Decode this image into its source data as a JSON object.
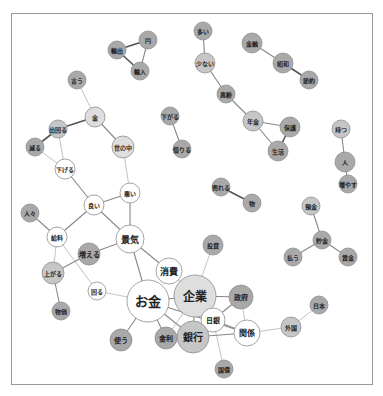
{
  "diagram": {
    "type": "co-occurrence network",
    "frame": {
      "x": 11,
      "y": 13,
      "w": 362,
      "h": 372
    },
    "colors": {
      "dark": "#a9a9a9",
      "medium": "#c6c6c6",
      "light": "#dedede",
      "white": "#ffffff",
      "stroke": "#8e8e8e",
      "edge_strong": "#555555",
      "edge_mid": "#888888",
      "edge_weak": "#c4c4c4"
    },
    "nodes": [
      {
        "id": "yushutsu",
        "label": "輸出",
        "x": 117,
        "y": 50,
        "r": 9,
        "fill": "dark",
        "fs": 6
      },
      {
        "id": "en",
        "label": "円",
        "x": 148,
        "y": 40,
        "r": 9,
        "fill": "dark",
        "fs": 6
      },
      {
        "id": "yunyu",
        "label": "輸入",
        "x": 140,
        "y": 71,
        "r": 9,
        "fill": "dark",
        "fs": 6
      },
      {
        "id": "ou",
        "label": "言う",
        "x": 77,
        "y": 80,
        "r": 9,
        "fill": "dark",
        "fs": 6
      },
      {
        "id": "kane",
        "label": "金",
        "x": 95,
        "y": 117,
        "r": 10,
        "fill": "light",
        "fs": 6
      },
      {
        "id": "demawaru",
        "label": "出回る",
        "x": 58,
        "y": 129,
        "r": 9,
        "fill": "medium",
        "fs": 6
      },
      {
        "id": "heru",
        "label": "減る",
        "x": 35,
        "y": 147,
        "r": 9,
        "fill": "dark",
        "fs": 6
      },
      {
        "id": "yononaka",
        "label": "世の中",
        "x": 123,
        "y": 147,
        "r": 11,
        "fill": "light",
        "fs": 6
      },
      {
        "id": "sageru",
        "label": "下げる",
        "x": 65,
        "y": 169,
        "r": 10,
        "fill": "white",
        "fs": 6
      },
      {
        "id": "sagaru",
        "label": "下がる",
        "x": 170,
        "y": 116,
        "r": 9,
        "fill": "dark",
        "fs": 6
      },
      {
        "id": "heru2",
        "label": "借りる",
        "x": 182,
        "y": 149,
        "r": 9,
        "fill": "dark",
        "fs": 6
      },
      {
        "id": "ooi",
        "label": "多い",
        "x": 203,
        "y": 31,
        "r": 9,
        "fill": "dark",
        "fs": 6
      },
      {
        "id": "sukunai",
        "label": "少ない",
        "x": 205,
        "y": 63,
        "r": 10,
        "fill": "medium",
        "fs": 6
      },
      {
        "id": "koreisha",
        "label": "高齢",
        "x": 226,
        "y": 94,
        "r": 9,
        "fill": "dark",
        "fs": 6
      },
      {
        "id": "kinri",
        "label": "金融",
        "x": 252,
        "y": 43,
        "r": 10,
        "fill": "dark",
        "fs": 6
      },
      {
        "id": "showa",
        "label": "昭和",
        "x": 283,
        "y": 63,
        "r": 10,
        "fill": "dark",
        "fs": 6
      },
      {
        "id": "yakusoku",
        "label": "節約",
        "x": 309,
        "y": 80,
        "r": 9,
        "fill": "dark",
        "fs": 6
      },
      {
        "id": "nenkin",
        "label": "年金",
        "x": 253,
        "y": 121,
        "r": 10,
        "fill": "medium",
        "fs": 6
      },
      {
        "id": "hoken",
        "label": "保護",
        "x": 290,
        "y": 127,
        "r": 10,
        "fill": "dark",
        "fs": 6
      },
      {
        "id": "seikatsu",
        "label": "生活",
        "x": 278,
        "y": 151,
        "r": 10,
        "fill": "dark",
        "fs": 6
      },
      {
        "id": "motsu",
        "label": "持つ",
        "x": 341,
        "y": 129,
        "r": 9,
        "fill": "medium",
        "fs": 6
      },
      {
        "id": "hito",
        "label": "人",
        "x": 345,
        "y": 162,
        "r": 10,
        "fill": "dark",
        "fs": 6
      },
      {
        "id": "fuyasu",
        "label": "増やす",
        "x": 348,
        "y": 184,
        "r": 9,
        "fill": "dark",
        "fs": 6
      },
      {
        "id": "ureru",
        "label": "売れる",
        "x": 221,
        "y": 187,
        "r": 9,
        "fill": "dark",
        "fs": 6
      },
      {
        "id": "mono",
        "label": "物",
        "x": 252,
        "y": 203,
        "r": 9,
        "fill": "dark",
        "fs": 6
      },
      {
        "id": "yokin",
        "label": "預金",
        "x": 311,
        "y": 206,
        "r": 9,
        "fill": "medium",
        "fs": 6
      },
      {
        "id": "chokin",
        "label": "貯金",
        "x": 322,
        "y": 240,
        "r": 9,
        "fill": "dark",
        "fs": 6
      },
      {
        "id": "harau",
        "label": "払う",
        "x": 293,
        "y": 257,
        "r": 9,
        "fill": "dark",
        "fs": 6
      },
      {
        "id": "chingin",
        "label": "賃金",
        "x": 348,
        "y": 257,
        "r": 9,
        "fill": "dark",
        "fs": 6
      },
      {
        "id": "yoi",
        "label": "良い",
        "x": 94,
        "y": 205,
        "r": 10,
        "fill": "white",
        "fs": 6
      },
      {
        "id": "warui",
        "label": "悪い",
        "x": 130,
        "y": 193,
        "r": 10,
        "fill": "white",
        "fs": 6
      },
      {
        "id": "hitobito",
        "label": "人々",
        "x": 30,
        "y": 213,
        "r": 9,
        "fill": "dark",
        "fs": 6
      },
      {
        "id": "kyuryo",
        "label": "給料",
        "x": 57,
        "y": 237,
        "r": 10,
        "fill": "white",
        "fs": 6
      },
      {
        "id": "keiki",
        "label": "景気",
        "x": 130,
        "y": 239,
        "r": 14,
        "fill": "white",
        "fs": 9
      },
      {
        "id": "fueru",
        "label": "増える",
        "x": 89,
        "y": 254,
        "r": 11,
        "fill": "dark",
        "fs": 7
      },
      {
        "id": "agaru",
        "label": "上がる",
        "x": 53,
        "y": 273,
        "r": 11,
        "fill": "medium",
        "fs": 6
      },
      {
        "id": "mawaru",
        "label": "回る",
        "x": 97,
        "y": 291,
        "r": 9,
        "fill": "white",
        "fs": 6
      },
      {
        "id": "bukka",
        "label": "物価",
        "x": 61,
        "y": 311,
        "r": 9,
        "fill": "dark",
        "fs": 6
      },
      {
        "id": "shohi",
        "label": "消費",
        "x": 169,
        "y": 271,
        "r": 13,
        "fill": "white",
        "fs": 9
      },
      {
        "id": "okane",
        "label": "お金",
        "x": 148,
        "y": 301,
        "r": 21,
        "fill": "white",
        "fs": 13
      },
      {
        "id": "kigyo",
        "label": "企業",
        "x": 195,
        "y": 296,
        "r": 21,
        "fill": "light",
        "fs": 12
      },
      {
        "id": "toshi",
        "label": "投資",
        "x": 213,
        "y": 245,
        "r": 10,
        "fill": "dark",
        "fs": 6
      },
      {
        "id": "seifu",
        "label": "政府",
        "x": 241,
        "y": 297,
        "r": 12,
        "fill": "dark",
        "fs": 7
      },
      {
        "id": "nichigin",
        "label": "日銀",
        "x": 213,
        "y": 320,
        "r": 12,
        "fill": "white",
        "fs": 7
      },
      {
        "id": "kankei",
        "label": "関係",
        "x": 247,
        "y": 333,
        "r": 13,
        "fill": "white",
        "fs": 8
      },
      {
        "id": "ginko",
        "label": "銀行",
        "x": 193,
        "y": 337,
        "r": 16,
        "fill": "medium",
        "fs": 10
      },
      {
        "id": "kinri2",
        "label": "金利",
        "x": 166,
        "y": 338,
        "r": 11,
        "fill": "dark",
        "fs": 7
      },
      {
        "id": "tsukau",
        "label": "使う",
        "x": 121,
        "y": 340,
        "r": 11,
        "fill": "dark",
        "fs": 7
      },
      {
        "id": "kokusai",
        "label": "国債",
        "x": 224,
        "y": 369,
        "r": 9,
        "fill": "dark",
        "fs": 6
      },
      {
        "id": "gaikoku",
        "label": "外国",
        "x": 291,
        "y": 327,
        "r": 10,
        "fill": "medium",
        "fs": 6
      },
      {
        "id": "nihon",
        "label": "日本",
        "x": 319,
        "y": 305,
        "r": 9,
        "fill": "dark",
        "fs": 6
      }
    ],
    "edges": [
      {
        "s": "yushutsu",
        "t": "en",
        "w": "strong"
      },
      {
        "s": "yushutsu",
        "t": "yunyu",
        "w": "strong"
      },
      {
        "s": "en",
        "t": "yunyu",
        "w": "mid"
      },
      {
        "s": "ou",
        "t": "kane",
        "w": "weak"
      },
      {
        "s": "kane",
        "t": "demawaru",
        "w": "strong"
      },
      {
        "s": "kane",
        "t": "yononaka",
        "w": "mid"
      },
      {
        "s": "demawaru",
        "t": "heru",
        "w": "strong"
      },
      {
        "s": "demawaru",
        "t": "sageru",
        "w": "weak"
      },
      {
        "s": "heru",
        "t": "sageru",
        "w": "weak"
      },
      {
        "s": "sageru",
        "t": "yoi",
        "w": "mid"
      },
      {
        "s": "yononaka",
        "t": "warui",
        "w": "weak"
      },
      {
        "s": "sagaru",
        "t": "heru2",
        "w": "mid"
      },
      {
        "s": "ooi",
        "t": "sukunai",
        "w": "mid"
      },
      {
        "s": "sukunai",
        "t": "koreisha",
        "w": "mid"
      },
      {
        "s": "koreisha",
        "t": "nenkin",
        "w": "mid"
      },
      {
        "s": "kinri",
        "t": "showa",
        "w": "mid"
      },
      {
        "s": "showa",
        "t": "yakusoku",
        "w": "strong"
      },
      {
        "s": "nenkin",
        "t": "hoken",
        "w": "mid"
      },
      {
        "s": "nenkin",
        "t": "seikatsu",
        "w": "mid"
      },
      {
        "s": "hoken",
        "t": "seikatsu",
        "w": "strong"
      },
      {
        "s": "motsu",
        "t": "hito",
        "w": "mid"
      },
      {
        "s": "hito",
        "t": "fuyasu",
        "w": "mid"
      },
      {
        "s": "ureru",
        "t": "mono",
        "w": "strong"
      },
      {
        "s": "yokin",
        "t": "chokin",
        "w": "mid"
      },
      {
        "s": "chokin",
        "t": "harau",
        "w": "mid"
      },
      {
        "s": "chokin",
        "t": "chingin",
        "w": "mid"
      },
      {
        "s": "yoi",
        "t": "warui",
        "w": "mid"
      },
      {
        "s": "yoi",
        "t": "kyuryo",
        "w": "mid"
      },
      {
        "s": "yoi",
        "t": "keiki",
        "w": "mid"
      },
      {
        "s": "warui",
        "t": "keiki",
        "w": "mid"
      },
      {
        "s": "hitobito",
        "t": "kyuryo",
        "w": "mid"
      },
      {
        "s": "kyuryo",
        "t": "agaru",
        "w": "weak"
      },
      {
        "s": "kyuryo",
        "t": "mawaru",
        "w": "weak"
      },
      {
        "s": "keiki",
        "t": "fueru",
        "w": "mid"
      },
      {
        "s": "keiki",
        "t": "shohi",
        "w": "mid"
      },
      {
        "s": "keiki",
        "t": "okane",
        "w": "mid"
      },
      {
        "s": "fueru",
        "t": "agaru",
        "w": "mid"
      },
      {
        "s": "agaru",
        "t": "bukka",
        "w": "mid"
      },
      {
        "s": "mawaru",
        "t": "okane",
        "w": "weak"
      },
      {
        "s": "shohi",
        "t": "kigyo",
        "w": "weak"
      },
      {
        "s": "okane",
        "t": "kigyo",
        "w": "mid"
      },
      {
        "s": "okane",
        "t": "tsukau",
        "w": "mid"
      },
      {
        "s": "okane",
        "t": "kinri2",
        "w": "mid"
      },
      {
        "s": "okane",
        "t": "ginko",
        "w": "mid"
      },
      {
        "s": "okane",
        "t": "kankei",
        "w": "mid"
      },
      {
        "s": "kigyo",
        "t": "toshi",
        "w": "weak"
      },
      {
        "s": "kigyo",
        "t": "seifu",
        "w": "mid"
      },
      {
        "s": "kigyo",
        "t": "ginko",
        "w": "mid"
      },
      {
        "s": "kigyo",
        "t": "nichigin",
        "w": "weak"
      },
      {
        "s": "kigyo",
        "t": "kinri2",
        "w": "weak"
      },
      {
        "s": "seifu",
        "t": "nichigin",
        "w": "mid"
      },
      {
        "s": "seifu",
        "t": "kankei",
        "w": "weak"
      },
      {
        "s": "nichigin",
        "t": "kankei",
        "w": "mid"
      },
      {
        "s": "nichigin",
        "t": "ginko",
        "w": "mid"
      },
      {
        "s": "nichigin",
        "t": "kokusai",
        "w": "weak"
      },
      {
        "s": "ginko",
        "t": "kankei",
        "w": "mid"
      },
      {
        "s": "kinri2",
        "t": "ginko",
        "w": "mid"
      },
      {
        "s": "kankei",
        "t": "gaikoku",
        "w": "weak"
      },
      {
        "s": "gaikoku",
        "t": "nihon",
        "w": "weak"
      }
    ]
  }
}
